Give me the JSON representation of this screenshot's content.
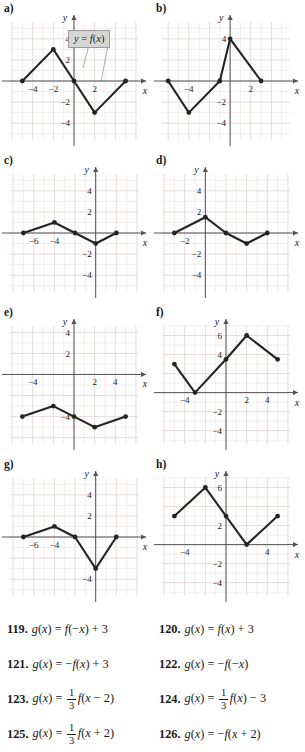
{
  "callout": {
    "text": "y = f(x)"
  },
  "axis_labels": {
    "x": "x",
    "y": "y"
  },
  "panels": [
    {
      "id": "a",
      "label": "a)",
      "xrange": [
        -6.2,
        6.2
      ],
      "yrange": [
        -5.6,
        5.6
      ],
      "x_ticks": [
        -4,
        -2,
        2
      ],
      "y_ticks": [
        -4,
        -2,
        2,
        4
      ],
      "points": [
        [
          -5,
          0
        ],
        [
          -2,
          3
        ],
        [
          0,
          0
        ],
        [
          2,
          -3
        ],
        [
          5,
          0
        ]
      ],
      "has_callout": true
    },
    {
      "id": "b",
      "label": "b)",
      "xrange": [
        -6.6,
        5.8
      ],
      "yrange": [
        -5.6,
        5.6
      ],
      "x_ticks": [
        -4,
        2
      ],
      "y_ticks": [
        -4,
        -2,
        4
      ],
      "points": [
        [
          -6,
          0
        ],
        [
          -4,
          -3
        ],
        [
          -1,
          0
        ],
        [
          0,
          4
        ],
        [
          3,
          0
        ]
      ],
      "has_callout": false
    },
    {
      "id": "c",
      "label": "c)",
      "xrange": [
        -8.3,
        4.1
      ],
      "yrange": [
        -5.6,
        5.6
      ],
      "x_ticks": [
        -6,
        -4
      ],
      "y_ticks": [
        -4,
        -2,
        2,
        4
      ],
      "points": [
        [
          -7,
          0
        ],
        [
          -4,
          1
        ],
        [
          -2,
          0
        ],
        [
          0,
          -1
        ],
        [
          2,
          0
        ]
      ],
      "has_callout": false
    },
    {
      "id": "d",
      "label": "d)",
      "xrange": [
        -4.2,
        8.2
      ],
      "yrange": [
        -5.6,
        5.6
      ],
      "x_ticks": [
        -2
      ],
      "y_ticks": [
        -4,
        -2,
        2,
        4
      ],
      "points": [
        [
          -3,
          0
        ],
        [
          0,
          1.5
        ],
        [
          2,
          0
        ],
        [
          4,
          -1
        ],
        [
          6,
          0
        ]
      ],
      "has_callout": false
    },
    {
      "id": "e",
      "label": "e)",
      "xrange": [
        -6.2,
        6.2
      ],
      "yrange": [
        -6.6,
        4.6
      ],
      "x_ticks": [
        -4,
        2,
        4
      ],
      "y_ticks": [
        -4,
        2,
        4
      ],
      "points": [
        [
          -5,
          -4
        ],
        [
          -2,
          -3
        ],
        [
          0,
          -4
        ],
        [
          2,
          -5
        ],
        [
          5,
          -4
        ]
      ],
      "has_callout": false
    },
    {
      "id": "f",
      "label": "f)",
      "xrange": [
        -6.2,
        6.2
      ],
      "yrange": [
        -5.4,
        7.0
      ],
      "x_ticks": [
        -4,
        2,
        4
      ],
      "y_ticks": [
        -4,
        -2,
        4,
        6
      ],
      "points": [
        [
          -5,
          3
        ],
        [
          -3,
          0
        ],
        [
          0,
          3.5
        ],
        [
          2,
          6
        ],
        [
          5,
          3.5
        ]
      ],
      "has_callout": false
    },
    {
      "id": "g",
      "label": "g)",
      "xrange": [
        -8.3,
        4.1
      ],
      "yrange": [
        -5.6,
        5.6
      ],
      "x_ticks": [
        -6,
        -4
      ],
      "y_ticks": [
        -4,
        2,
        4
      ],
      "points": [
        [
          -7,
          0
        ],
        [
          -4,
          1
        ],
        [
          -2,
          0
        ],
        [
          0,
          -3
        ],
        [
          2,
          0
        ]
      ],
      "has_callout": false
    },
    {
      "id": "h",
      "label": "h)",
      "xrange": [
        -6.2,
        6.2
      ],
      "yrange": [
        -5.4,
        7.0
      ],
      "x_ticks": [
        -4,
        4
      ],
      "y_ticks": [
        -4,
        -2,
        2,
        6
      ],
      "points": [
        [
          -5,
          3
        ],
        [
          -2,
          6
        ],
        [
          0,
          3
        ],
        [
          2,
          0
        ],
        [
          5,
          3
        ]
      ],
      "has_callout": false
    }
  ],
  "exercises": [
    {
      "number": "119.",
      "tokens": [
        {
          "t": "g",
          "italic": true
        },
        {
          "t": "("
        },
        {
          "t": "x",
          "italic": true
        },
        {
          "t": ") = "
        },
        {
          "t": "f",
          "italic": true
        },
        {
          "t": "(−"
        },
        {
          "t": "x",
          "italic": true
        },
        {
          "t": ") + 3"
        }
      ]
    },
    {
      "number": "120.",
      "tokens": [
        {
          "t": "g",
          "italic": true
        },
        {
          "t": "("
        },
        {
          "t": "x",
          "italic": true
        },
        {
          "t": ") = "
        },
        {
          "t": "f",
          "italic": true
        },
        {
          "t": "("
        },
        {
          "t": "x",
          "italic": true
        },
        {
          "t": ") + 3"
        }
      ]
    },
    {
      "number": "121.",
      "tokens": [
        {
          "t": "g",
          "italic": true
        },
        {
          "t": "("
        },
        {
          "t": "x",
          "italic": true
        },
        {
          "t": ") = −"
        },
        {
          "t": "f",
          "italic": true
        },
        {
          "t": "("
        },
        {
          "t": "x",
          "italic": true
        },
        {
          "t": ") + 3"
        }
      ]
    },
    {
      "number": "122.",
      "tokens": [
        {
          "t": "g",
          "italic": true
        },
        {
          "t": "("
        },
        {
          "t": "x",
          "italic": true
        },
        {
          "t": ") = −"
        },
        {
          "t": "f",
          "italic": true
        },
        {
          "t": "(−"
        },
        {
          "t": "x",
          "italic": true
        },
        {
          "t": ")"
        }
      ]
    },
    {
      "number": "123.",
      "fraction": {
        "num": "1",
        "den": "3"
      },
      "pre": [
        {
          "t": "g",
          "italic": true
        },
        {
          "t": "("
        },
        {
          "t": "x",
          "italic": true
        },
        {
          "t": ") = "
        }
      ],
      "post": [
        {
          "t": "f",
          "italic": true
        },
        {
          "t": "("
        },
        {
          "t": "x",
          "italic": true
        },
        {
          "t": " − 2)"
        }
      ]
    },
    {
      "number": "124.",
      "fraction": {
        "num": "1",
        "den": "3"
      },
      "pre": [
        {
          "t": "g",
          "italic": true
        },
        {
          "t": "("
        },
        {
          "t": "x",
          "italic": true
        },
        {
          "t": ") = "
        }
      ],
      "post": [
        {
          "t": "f",
          "italic": true
        },
        {
          "t": "("
        },
        {
          "t": "x",
          "italic": true
        },
        {
          "t": ") − 3"
        }
      ]
    },
    {
      "number": "125.",
      "fraction": {
        "num": "1",
        "den": "3"
      },
      "pre": [
        {
          "t": "g",
          "italic": true
        },
        {
          "t": "("
        },
        {
          "t": "x",
          "italic": true
        },
        {
          "t": ") = "
        }
      ],
      "post": [
        {
          "t": "f",
          "italic": true
        },
        {
          "t": "("
        },
        {
          "t": "x",
          "italic": true
        },
        {
          "t": " + 2)"
        }
      ]
    },
    {
      "number": "126.",
      "tokens": [
        {
          "t": "g",
          "italic": true
        },
        {
          "t": "("
        },
        {
          "t": "x",
          "italic": true
        },
        {
          "t": ") = −"
        },
        {
          "t": "f",
          "italic": true
        },
        {
          "t": "("
        },
        {
          "t": "x",
          "italic": true
        },
        {
          "t": " + 2)"
        }
      ]
    }
  ],
  "style": {
    "grid_color": "#ece3e3",
    "grid_major_color": "#ded2d2",
    "axis_color": "#555555",
    "curve_color": "#242424",
    "callout_bg": "#d6d6d6",
    "callout_border": "#9a9a9a",
    "text_color": "#1a1a1a"
  }
}
